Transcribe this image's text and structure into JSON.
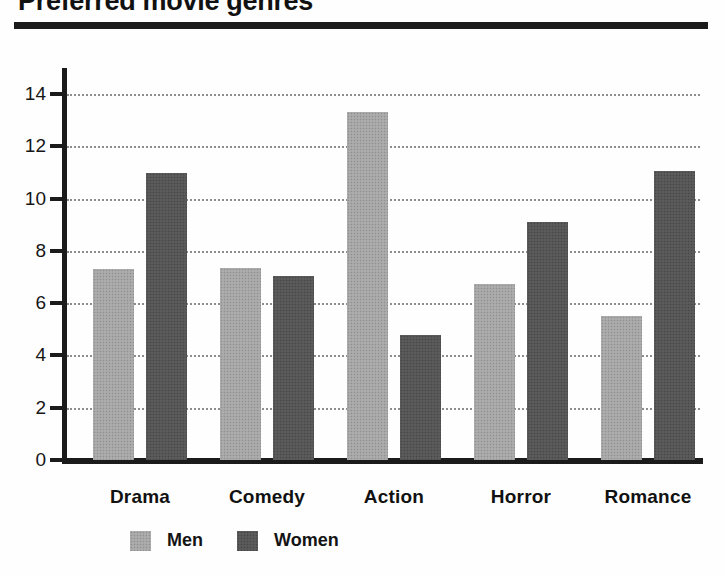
{
  "chart_data": {
    "type": "bar",
    "title": "Preferred movie genres",
    "xlabel": "",
    "ylabel": "",
    "categories": [
      "Drama",
      "Comedy",
      "Action",
      "Horror",
      "Romance"
    ],
    "series": [
      {
        "name": "Men",
        "color": "#a6a6a6",
        "values": [
          7.3,
          7.35,
          13.3,
          6.75,
          5.5
        ]
      },
      {
        "name": "Women",
        "color": "#565656",
        "values": [
          11.0,
          7.05,
          4.8,
          9.1,
          11.05
        ]
      }
    ],
    "ylim": [
      0,
      15
    ],
    "yticks": [
      0,
      2,
      4,
      6,
      8,
      10,
      12,
      14
    ],
    "ytick_labels": [
      "0",
      "2",
      "4",
      "6",
      "8",
      "10",
      "12",
      "14"
    ],
    "grid": true,
    "grid_style": "dotted horizontal",
    "legend_position": "bottom-left"
  },
  "legend": {
    "entries": [
      {
        "label": "Men",
        "swatch": "light-gray-swatch"
      },
      {
        "label": "Women",
        "swatch": "dark-gray-swatch"
      }
    ]
  }
}
